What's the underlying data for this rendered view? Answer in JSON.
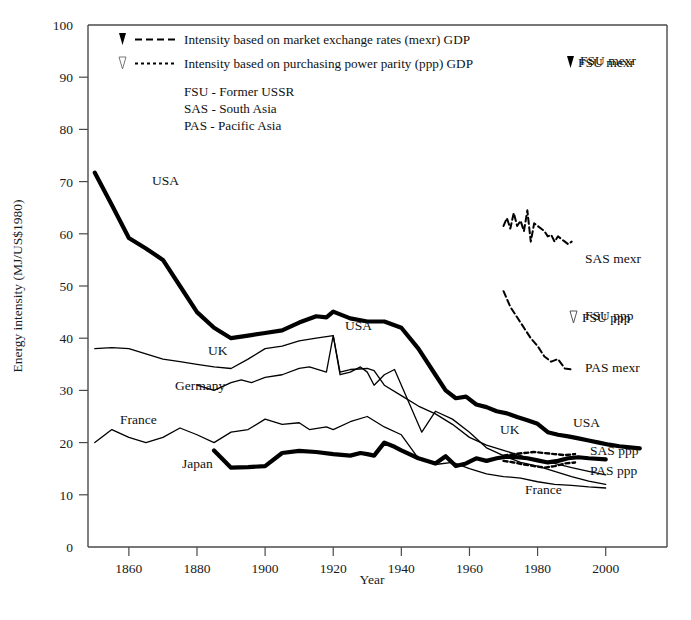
{
  "chart_data": {
    "type": "line",
    "title": "",
    "xlabel": "Year",
    "ylabel": "Energy intensity (MJ/US$1980)",
    "xlim": [
      1848,
      2018
    ],
    "ylim": [
      0,
      100
    ],
    "xticks": [
      1860,
      1880,
      1900,
      1920,
      1940,
      1960,
      1980,
      2000
    ],
    "yticks": [
      0,
      10,
      20,
      30,
      40,
      50,
      60,
      70,
      80,
      90,
      100
    ],
    "grid": false,
    "legend_position": "inside-top-left",
    "legend": [
      {
        "marker": "filled-triangle",
        "line": "long-dash",
        "label": "Intensity based on market exchange rates (mexr) GDP"
      },
      {
        "marker": "open-triangle",
        "line": "short-dash",
        "label": "Intensity based on purchasing power parity (ppp) GDP"
      }
    ],
    "abbreviations": [
      "FSU - Former USSR",
      "SAS - South Asia",
      "PAS - Pacific Asia"
    ],
    "annotations": [
      {
        "text": "USA",
        "x": 152,
        "y": 185
      },
      {
        "text": "USA",
        "x": 345,
        "y": 330
      },
      {
        "text": "UK",
        "x": 208,
        "y": 355
      },
      {
        "text": "Germany",
        "x": 175,
        "y": 390
      },
      {
        "text": "France",
        "x": 120,
        "y": 424
      },
      {
        "text": "Japan",
        "x": 182,
        "y": 468
      },
      {
        "text": "UK",
        "x": 500,
        "y": 434
      },
      {
        "text": "USA",
        "x": 573,
        "y": 427
      },
      {
        "text": "France",
        "x": 525,
        "y": 494
      },
      {
        "text": "SAS mexr",
        "x": 585,
        "y": 263
      },
      {
        "text": "PAS mexr",
        "x": 585,
        "y": 372
      },
      {
        "text": "SAS ppp",
        "x": 590,
        "y": 455
      },
      {
        "text": "PAS ppp",
        "x": 590,
        "y": 475
      },
      {
        "text": "FSU ppp",
        "x": 585,
        "y": 320
      },
      {
        "text": "FSU mexr",
        "x": 580,
        "y": 65
      }
    ],
    "marker_keys": [
      {
        "label": "FSU mexr",
        "marker": "filled-triangle"
      },
      {
        "label": "FSU ppp",
        "marker": "open-triangle"
      }
    ],
    "series": [
      {
        "name": "USA",
        "style": "thick-solid",
        "x": [
          1850,
          1855,
          1860,
          1865,
          1870,
          1875,
          1880,
          1885,
          1890,
          1895,
          1900,
          1905,
          1910,
          1915,
          1918,
          1920,
          1925,
          1930,
          1935,
          1940,
          1945,
          1950,
          1953,
          1956,
          1959,
          1962,
          1965,
          1968,
          1971,
          1974,
          1977,
          1980,
          1983,
          1986,
          1989,
          1992,
          1995,
          1998,
          2001,
          2004,
          2007,
          2010
        ],
        "y": [
          71.7,
          65.5,
          59.2,
          57.2,
          55.0,
          50.0,
          45.0,
          42.0,
          40.0,
          40.5,
          41.0,
          41.5,
          43.0,
          44.2,
          44.0,
          45.1,
          43.8,
          43.2,
          43.2,
          42.0,
          38.0,
          33.0,
          30.0,
          28.5,
          28.8,
          27.3,
          26.8,
          26.0,
          25.6,
          24.9,
          24.3,
          23.6,
          22.0,
          21.5,
          21.2,
          20.8,
          20.4,
          20.0,
          19.6,
          19.3,
          19.1,
          18.9
        ]
      },
      {
        "name": "UK",
        "style": "thin-solid",
        "x": [
          1850,
          1855,
          1860,
          1865,
          1870,
          1875,
          1880,
          1885,
          1890,
          1895,
          1900,
          1905,
          1910,
          1915,
          1920,
          1922,
          1925,
          1930,
          1932,
          1935,
          1940,
          1945,
          1950,
          1955,
          1960,
          1965,
          1970,
          1975,
          1980,
          1985,
          1990,
          1995,
          2000
        ],
        "y": [
          38.0,
          38.2,
          38.0,
          37.0,
          36.0,
          35.5,
          35.0,
          34.5,
          34.2,
          36.0,
          38.0,
          38.5,
          39.5,
          40.0,
          40.5,
          33.5,
          34.0,
          34.2,
          33.8,
          31.0,
          29.0,
          27.0,
          25.5,
          23.5,
          21.0,
          19.5,
          18.5,
          17.5,
          16.5,
          16.0,
          15.2,
          14.5,
          13.8
        ]
      },
      {
        "name": "Germany",
        "style": "thin-solid",
        "x": [
          1880,
          1885,
          1890,
          1893,
          1896,
          1900,
          1905,
          1910,
          1913,
          1918,
          1920,
          1922,
          1925,
          1928,
          1930,
          1932,
          1935,
          1938,
          1946,
          1950,
          1955,
          1960,
          1965,
          1970,
          1975,
          1980,
          1985,
          1990,
          1995,
          2000
        ],
        "y": [
          31.0,
          30.0,
          31.5,
          32.0,
          31.5,
          32.5,
          33.0,
          34.2,
          34.5,
          33.5,
          40.5,
          33.0,
          33.5,
          34.5,
          33.5,
          31.0,
          33.0,
          34.0,
          22.0,
          26.0,
          24.5,
          22.0,
          19.0,
          17.5,
          16.2,
          15.5,
          14.5,
          13.5,
          12.6,
          12.0
        ]
      },
      {
        "name": "France",
        "style": "thin-solid",
        "x": [
          1850,
          1855,
          1860,
          1865,
          1870,
          1875,
          1880,
          1885,
          1890,
          1895,
          1900,
          1905,
          1910,
          1913,
          1918,
          1920,
          1925,
          1930,
          1935,
          1940,
          1945,
          1950,
          1955,
          1960,
          1965,
          1970,
          1975,
          1980,
          1985,
          1990,
          1995,
          2000
        ],
        "y": [
          20.0,
          22.5,
          21.0,
          20.0,
          21.0,
          22.8,
          21.5,
          20.0,
          22.0,
          22.5,
          24.5,
          23.5,
          23.8,
          22.5,
          23.0,
          22.5,
          24.0,
          25.0,
          23.0,
          21.5,
          17.0,
          15.8,
          16.2,
          15.0,
          14.0,
          13.5,
          13.2,
          12.5,
          12.0,
          11.8,
          11.5,
          11.3
        ]
      },
      {
        "name": "Japan",
        "style": "thick-solid",
        "x": [
          1885,
          1890,
          1895,
          1900,
          1905,
          1910,
          1915,
          1920,
          1925,
          1928,
          1930,
          1932,
          1935,
          1938,
          1940,
          1945,
          1950,
          1953,
          1956,
          1959,
          1962,
          1965,
          1968,
          1971,
          1974,
          1977,
          1980,
          1983,
          1986,
          1989,
          1992,
          1995,
          2000
        ],
        "y": [
          18.5,
          15.2,
          15.3,
          15.5,
          18.0,
          18.4,
          18.2,
          17.8,
          17.5,
          18.0,
          17.8,
          17.5,
          20.0,
          19.2,
          18.5,
          17.0,
          16.0,
          17.4,
          15.5,
          16.0,
          17.0,
          16.5,
          17.0,
          17.3,
          17.2,
          17.0,
          16.6,
          16.2,
          16.5,
          17.0,
          17.2,
          17.0,
          16.8
        ]
      },
      {
        "name": "SAS mexr",
        "style": "dash-thin",
        "x": [
          1970,
          1971,
          1972,
          1973,
          1974,
          1975,
          1976,
          1977,
          1978,
          1979,
          1980,
          1981,
          1982,
          1983,
          1984,
          1985,
          1986,
          1987,
          1988,
          1989,
          1990
        ],
        "y": [
          61.5,
          63.0,
          61.0,
          64.0,
          61.5,
          62.5,
          60.5,
          64.5,
          58.5,
          62.0,
          61.5,
          61.0,
          60.5,
          59.5,
          59.8,
          58.5,
          59.5,
          59.0,
          58.5,
          58.0,
          58.5
        ]
      },
      {
        "name": "PAS mexr",
        "style": "dash-thin",
        "x": [
          1970,
          1972,
          1974,
          1976,
          1978,
          1980,
          1982,
          1984,
          1986,
          1988,
          1990
        ],
        "y": [
          49.0,
          46.0,
          44.0,
          42.0,
          40.0,
          38.5,
          36.5,
          35.5,
          36.0,
          34.2,
          34.0
        ]
      },
      {
        "name": "SAS ppp",
        "style": "dot-thin",
        "x": [
          1970,
          1973,
          1976,
          1979,
          1982,
          1985,
          1988,
          1991
        ],
        "y": [
          17.5,
          17.8,
          18.0,
          18.2,
          18.0,
          17.8,
          17.6,
          17.8
        ]
      },
      {
        "name": "PAS ppp",
        "style": "dot-thin",
        "x": [
          1970,
          1973,
          1976,
          1979,
          1982,
          1985,
          1988,
          1991
        ],
        "y": [
          16.5,
          16.2,
          15.8,
          15.5,
          15.2,
          15.5,
          16.0,
          16.2
        ]
      }
    ]
  }
}
